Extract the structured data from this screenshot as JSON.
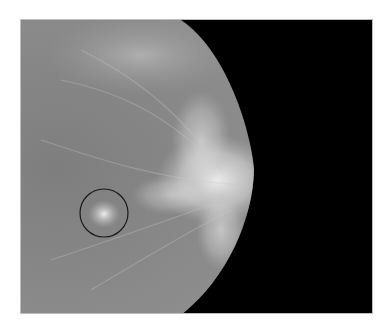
{
  "image": {
    "description": "Grayscale mammogram, lateral view of breast against black background",
    "background_color": "#000000",
    "tissue_color": "#8a8a8a",
    "dense_tissue_color": "#e8e8e8"
  },
  "annotation": {
    "shape": "circle",
    "label": "",
    "center_x": 103,
    "center_y": 212,
    "radius": 24,
    "stroke_color": "#1a1a1a",
    "description": "Circled spiculated lesion"
  }
}
